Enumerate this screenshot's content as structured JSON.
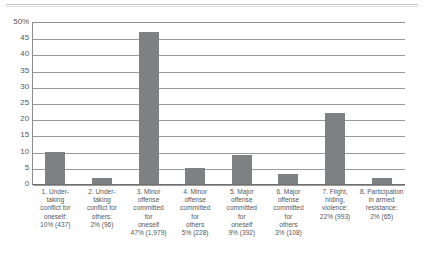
{
  "chart_data": {
    "type": "bar",
    "title": "",
    "subtitle": "",
    "xlabel": "",
    "ylabel": "",
    "ylim": [
      0,
      50
    ],
    "ytick_step": 5,
    "grid": true,
    "legend": "none",
    "orientation": "vertical",
    "bar_color": "#7f8082",
    "axis_color": "#8d8d8d",
    "yticks": [
      "50%",
      "45",
      "40",
      "35",
      "30",
      "25",
      "20",
      "15",
      "10",
      "5",
      "0"
    ],
    "ytick_values": [
      50,
      45,
      40,
      35,
      30,
      25,
      20,
      15,
      10,
      5,
      0
    ],
    "categories": [
      "1. Undertaking conflict for oneself:",
      "2. Undertaking conflict for others:",
      "3. Minor offense committed for oneself",
      "4. Minor offense committed for others",
      "5. Major offense committed for oneself",
      "6. Major offense committed for others",
      "7. Flight, hiding, violence:",
      "8. Participation in armed resistance:"
    ],
    "values": [
      10,
      2,
      47,
      5,
      9,
      3,
      22,
      2
    ],
    "counts": [
      437,
      96,
      1979,
      228,
      392,
      108,
      993,
      65
    ],
    "value_labels": [
      "10% (437)",
      "2% (96)",
      "47% (1,979)",
      "5% (228)",
      "9% (392)",
      "3% (108)",
      "22% (993)",
      "2% (65)"
    ],
    "category_label_lines": [
      [
        "1. Under-",
        "taking",
        "conflict for",
        "oneself:",
        "10% (437)"
      ],
      [
        "2. Under-",
        "taking",
        "conflict for",
        "others:",
        "2% (96)"
      ],
      [
        "3. Minor",
        "offense",
        "committed",
        "for",
        "oneself",
        "47% (1,979)"
      ],
      [
        "4. Minor",
        "offense",
        "committed",
        "for",
        "others",
        "5% (228)"
      ],
      [
        "5. Major",
        "offense",
        "committed",
        "for",
        "oneself",
        "9% (392)"
      ],
      [
        "6. Major",
        "offense",
        "committed",
        "for",
        "others",
        "3% (108)"
      ],
      [
        "7. Flight,",
        "hiding,",
        "violence:",
        "22% (993)"
      ],
      [
        "8. Participation",
        "in armed",
        "resistance:",
        "2% (65)"
      ]
    ]
  }
}
